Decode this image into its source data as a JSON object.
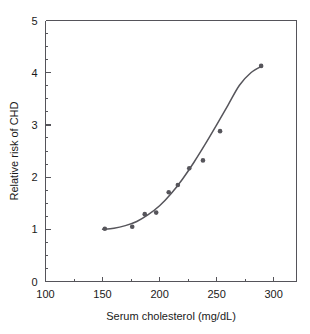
{
  "chart_data": {
    "type": "scatter",
    "title": "",
    "xlabel": "Serum cholesterol (mg/dL)",
    "ylabel": "Relative risk of CHD",
    "xlim": [
      100,
      320
    ],
    "ylim": [
      0,
      5
    ],
    "xticks": [
      100,
      150,
      200,
      250,
      300
    ],
    "xtick_labels": [
      "100",
      "150",
      "200",
      "250",
      "300"
    ],
    "x_minor_step": 25,
    "yticks": [
      0,
      1,
      2,
      3,
      4,
      5
    ],
    "ytick_labels": [
      "0",
      "1",
      "2",
      "3",
      "4",
      "5"
    ],
    "y_minor_step": 0.25,
    "grid": false,
    "legend": false,
    "series": [
      {
        "name": "Relative risk of CHD",
        "marker": "filled-circle",
        "color": "#56555b",
        "x": [
          152,
          176,
          187,
          197,
          208,
          216,
          226,
          238,
          253,
          289
        ],
        "y": [
          1.01,
          1.05,
          1.29,
          1.32,
          1.71,
          1.85,
          2.17,
          2.32,
          2.88,
          4.13
        ]
      },
      {
        "name": "fitted curve",
        "type": "line",
        "color": "#56555b",
        "x": [
          150,
          160,
          170,
          180,
          190,
          200,
          210,
          220,
          230,
          240,
          250,
          260,
          270,
          280,
          290
        ],
        "y": [
          1.0,
          1.02,
          1.07,
          1.15,
          1.28,
          1.45,
          1.68,
          1.96,
          2.28,
          2.63,
          3.0,
          3.38,
          3.76,
          4.0,
          4.13
        ]
      }
    ]
  },
  "axes": {
    "x_title": "Serum cholesterol (mg/dL)",
    "y_title": "Relative risk of CHD"
  },
  "colors": {
    "data": "#56555b",
    "axis": "#55545a",
    "background": "#ffffff"
  }
}
